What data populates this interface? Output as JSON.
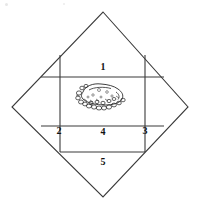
{
  "figure": {
    "title": "",
    "background_color": "#ffffff",
    "line_color": "#3a3a3a",
    "label_color": "#111111",
    "width": 201,
    "height": 205
  },
  "diamond": {
    "name": "diamond-outline",
    "points": "103,12 188,107 103,197 12,107",
    "top": {
      "x": 103,
      "y": 12
    },
    "right": {
      "x": 188,
      "y": 107
    },
    "bottom": {
      "x": 103,
      "y": 197
    },
    "left": {
      "x": 12,
      "y": 107
    }
  },
  "grid": {
    "left_x": 60,
    "right_x": 145,
    "top_y": 55,
    "upper_divider_y": 77,
    "lower_divider_y": 126,
    "bottom_y": 152
  },
  "regions": [
    {
      "id": 1,
      "label": "1",
      "x": 96,
      "y": 62
    },
    {
      "id": 2,
      "label": "2",
      "x": 52,
      "y": 126
    },
    {
      "id": 3,
      "label": "3",
      "x": 138,
      "y": 126
    },
    {
      "id": 4,
      "label": "4",
      "x": 96,
      "y": 127
    },
    {
      "id": 5,
      "label": "5",
      "x": 96,
      "y": 157
    }
  ],
  "sketch": {
    "name": "stippled-mass-sketch",
    "description": "hand-drawn textured rounded mass with stippling",
    "center": {
      "x": 99,
      "y": 97
    },
    "bounds": {
      "x": 73,
      "y": 83,
      "width": 53,
      "height": 28
    }
  },
  "artifacts": [
    {
      "name": "scan-speck-left",
      "x": 5,
      "y": 3,
      "size": 3
    },
    {
      "name": "scan-speck-right",
      "x": 63,
      "y": 3,
      "size": 2
    }
  ]
}
